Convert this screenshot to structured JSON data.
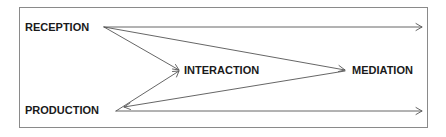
{
  "diagram": {
    "nodes": {
      "reception": "RECEPTION",
      "production": "PRODUCTION",
      "interaction": "INTERACTION",
      "mediation": "MEDIATION"
    },
    "edges": [
      {
        "from": "reception",
        "to": "right-edge"
      },
      {
        "from": "reception",
        "to": "interaction"
      },
      {
        "from": "reception",
        "to": "mediation"
      },
      {
        "from": "production",
        "to": "interaction"
      },
      {
        "from": "interaction",
        "to": "production"
      },
      {
        "from": "mediation",
        "to": "production"
      },
      {
        "from": "production",
        "to": "right-edge"
      }
    ],
    "colors": {
      "line": "#555555",
      "frame": "#8a8a8a",
      "text": "#1a1a1a"
    }
  }
}
